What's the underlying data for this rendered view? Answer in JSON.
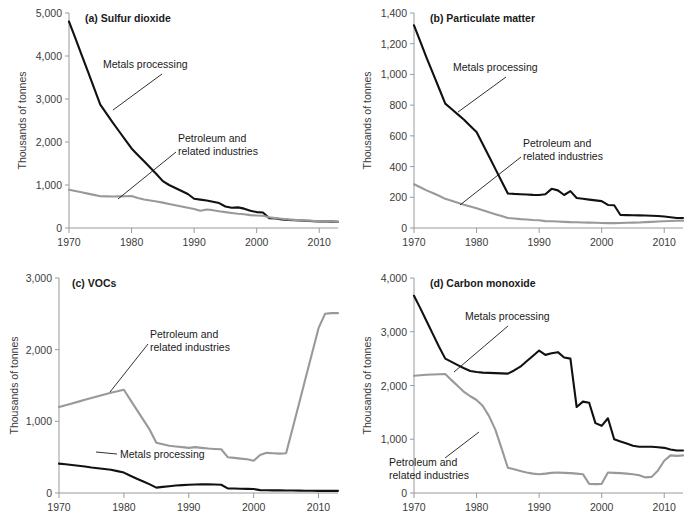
{
  "figure": {
    "shared_ylabel": "Thousands of tonnes",
    "colors": {
      "metals_processing": "#111111",
      "petroleum_related": "#999999",
      "axis": "#9a9a9a",
      "text": "#1a1a1a"
    },
    "series_labels": {
      "metals": "Metals processing",
      "petroleum_line1": "Petroleum and",
      "petroleum_line2": "related industries"
    }
  },
  "chart_data": [
    {
      "id": "a",
      "type": "line",
      "title": "(a) Sulfur dioxide",
      "xlabel": "",
      "ylabel": "Thousands of tonnes",
      "xlim": [
        1970,
        2013
      ],
      "ylim": [
        0,
        5000
      ],
      "xticks": [
        1970,
        1980,
        1990,
        2000,
        2010
      ],
      "xticklabels": [
        "1970",
        "1980",
        "1990",
        "2000",
        "2010"
      ],
      "yticks": [
        0,
        1000,
        2000,
        3000,
        4000,
        5000
      ],
      "yticklabels": [
        "0",
        "1,000",
        "2,000",
        "3,000",
        "4,000",
        "5,000"
      ],
      "grid": false,
      "legend": "annotated-inline",
      "annotations": [
        {
          "text": "Metals processing",
          "target_year": 1975,
          "target_value": 2870
        },
        {
          "text": "Petroleum and related industries",
          "target_year": 1977,
          "target_value": 730
        }
      ],
      "x": [
        1970,
        1971,
        1972,
        1973,
        1974,
        1975,
        1976,
        1977,
        1978,
        1979,
        1980,
        1981,
        1982,
        1983,
        1984,
        1985,
        1986,
        1987,
        1988,
        1989,
        1990,
        1991,
        1992,
        1993,
        1994,
        1995,
        1996,
        1997,
        1998,
        1999,
        2000,
        2001,
        2002,
        2003,
        2004,
        2005,
        2006,
        2007,
        2008,
        2009,
        2010,
        2011,
        2012,
        2013
      ],
      "series": [
        {
          "name": "Metals processing",
          "color": "#111111",
          "values": [
            4800,
            4420,
            4030,
            3650,
            3260,
            2870,
            2660,
            2450,
            2250,
            2050,
            1850,
            1700,
            1550,
            1400,
            1250,
            1090,
            1000,
            930,
            860,
            790,
            680,
            660,
            640,
            610,
            580,
            500,
            470,
            480,
            450,
            400,
            370,
            360,
            230,
            220,
            200,
            190,
            180,
            175,
            170,
            160,
            155,
            150,
            148,
            145
          ]
        },
        {
          "name": "Petroleum and related industries",
          "color": "#999999",
          "values": [
            890,
            860,
            830,
            800,
            770,
            740,
            735,
            732,
            735,
            740,
            745,
            700,
            665,
            640,
            615,
            590,
            560,
            530,
            500,
            470,
            440,
            400,
            430,
            415,
            390,
            370,
            350,
            330,
            320,
            300,
            290,
            285,
            250,
            230,
            215,
            200,
            190,
            180,
            175,
            165,
            160,
            155,
            150,
            145
          ]
        }
      ]
    },
    {
      "id": "b",
      "type": "line",
      "title": "(b) Particulate matter",
      "xlabel": "",
      "ylabel": "Thousands of tonnes",
      "xlim": [
        1970,
        2013
      ],
      "ylim": [
        0,
        1400
      ],
      "xticks": [
        1970,
        1980,
        1990,
        2000,
        2010
      ],
      "xticklabels": [
        "1970",
        "1980",
        "1990",
        "2000",
        "2010"
      ],
      "yticks": [
        0,
        200,
        400,
        600,
        800,
        1000,
        1200,
        1400
      ],
      "yticklabels": [
        "0",
        "200",
        "400",
        "600",
        "800",
        "1,000",
        "1,200",
        "1,400"
      ],
      "grid": false,
      "legend": "annotated-inline",
      "annotations": [
        {
          "text": "Metals processing",
          "target_year": 1975,
          "target_value": 810
        },
        {
          "text": "Petroleum and related industries",
          "target_year": 1977,
          "target_value": 150
        }
      ],
      "x": [
        1970,
        1971,
        1972,
        1973,
        1974,
        1975,
        1976,
        1977,
        1978,
        1979,
        1980,
        1981,
        1982,
        1983,
        1984,
        1985,
        1986,
        1987,
        1988,
        1989,
        1990,
        1991,
        1992,
        1993,
        1994,
        1995,
        1996,
        1997,
        1998,
        1999,
        2000,
        2001,
        2002,
        2003,
        2004,
        2005,
        2006,
        2007,
        2008,
        2009,
        2010,
        2011,
        2012,
        2013
      ],
      "series": [
        {
          "name": "Metals processing",
          "color": "#111111",
          "values": [
            1320,
            1215,
            1110,
            1010,
            910,
            810,
            775,
            740,
            705,
            665,
            625,
            545,
            465,
            385,
            305,
            225,
            222,
            220,
            218,
            216,
            215,
            220,
            255,
            245,
            215,
            240,
            195,
            190,
            185,
            180,
            175,
            150,
            148,
            85,
            84,
            83,
            82,
            81,
            80,
            78,
            75,
            70,
            65,
            65
          ]
        },
        {
          "name": "Petroleum and related industries",
          "color": "#999999",
          "values": [
            285,
            265,
            245,
            228,
            210,
            190,
            178,
            165,
            152,
            140,
            128,
            115,
            102,
            90,
            78,
            65,
            62,
            58,
            55,
            52,
            50,
            45,
            44,
            42,
            40,
            38,
            37,
            36,
            35,
            34,
            33,
            32,
            32,
            33,
            34,
            35,
            36,
            38,
            40,
            42,
            44,
            46,
            47,
            48
          ]
        }
      ]
    },
    {
      "id": "c",
      "type": "line",
      "title": "(c) VOCs",
      "xlabel": "",
      "ylabel": "Thousands of tonnes",
      "xlim": [
        1970,
        2013
      ],
      "ylim": [
        0,
        3000
      ],
      "xticks": [
        1970,
        1980,
        1990,
        2000,
        2010
      ],
      "xticklabels": [
        "1970",
        "1980",
        "1990",
        "2000",
        "2010"
      ],
      "yticks": [
        0,
        1000,
        2000,
        3000
      ],
      "yticklabels": [
        "0",
        "1,000",
        "2,000",
        "3,000"
      ],
      "grid": false,
      "legend": "annotated-inline",
      "annotations": [
        {
          "text": "Petroleum and related industries",
          "target_year": 1981,
          "target_value": 1430
        },
        {
          "text": "Metals processing",
          "target_year": 1978,
          "target_value": 325
        }
      ],
      "x": [
        1970,
        1971,
        1972,
        1973,
        1974,
        1975,
        1976,
        1977,
        1978,
        1979,
        1980,
        1981,
        1982,
        1983,
        1984,
        1985,
        1986,
        1987,
        1988,
        1989,
        1990,
        1991,
        1992,
        1993,
        1994,
        1995,
        1996,
        1997,
        1998,
        1999,
        2000,
        2001,
        2002,
        2003,
        2004,
        2005,
        2006,
        2007,
        2008,
        2009,
        2010,
        2011,
        2012,
        2013
      ],
      "series": [
        {
          "name": "Petroleum and related industries",
          "color": "#999999",
          "values": [
            1200,
            1225,
            1250,
            1275,
            1300,
            1325,
            1350,
            1375,
            1400,
            1420,
            1440,
            1300,
            1160,
            1020,
            880,
            700,
            680,
            660,
            650,
            640,
            630,
            640,
            630,
            620,
            615,
            610,
            500,
            490,
            480,
            470,
            450,
            530,
            560,
            555,
            550,
            555,
            900,
            1250,
            1600,
            1950,
            2300,
            2500,
            2510,
            2510
          ]
        },
        {
          "name": "Metals processing",
          "color": "#111111",
          "values": [
            410,
            400,
            390,
            380,
            370,
            355,
            345,
            335,
            325,
            305,
            285,
            240,
            200,
            160,
            120,
            75,
            85,
            95,
            105,
            110,
            115,
            118,
            120,
            120,
            118,
            115,
            65,
            62,
            60,
            58,
            55,
            40,
            38,
            37,
            36,
            35,
            34,
            33,
            32,
            31,
            30,
            30,
            30,
            30
          ]
        }
      ]
    },
    {
      "id": "d",
      "type": "line",
      "title": "(d) Carbon monoxide",
      "xlabel": "",
      "ylabel": "Thousands of tonnes",
      "xlim": [
        1970,
        2013
      ],
      "ylim": [
        0,
        4000
      ],
      "xticks": [
        1970,
        1980,
        1990,
        2000,
        2010
      ],
      "xticklabels": [
        "1970",
        "1980",
        "1990",
        "2000",
        "2010"
      ],
      "yticks": [
        0,
        1000,
        2000,
        3000,
        4000
      ],
      "yticklabels": [
        "0",
        "1,000",
        "2,000",
        "3,000",
        "4,000"
      ],
      "grid": false,
      "legend": "annotated-inline",
      "annotations": [
        {
          "text": "Metals processing",
          "target_year": 1977,
          "target_value": 2380
        },
        {
          "text": "Petroleum and related industries",
          "target_year": 1983,
          "target_value": 1180
        }
      ],
      "x": [
        1970,
        1971,
        1972,
        1973,
        1974,
        1975,
        1976,
        1977,
        1978,
        1979,
        1980,
        1981,
        1982,
        1983,
        1984,
        1985,
        1986,
        1987,
        1988,
        1989,
        1990,
        1991,
        1992,
        1993,
        1994,
        1995,
        1996,
        1997,
        1998,
        1999,
        2000,
        2001,
        2002,
        2003,
        2004,
        2005,
        2006,
        2007,
        2008,
        2009,
        2010,
        2011,
        2012,
        2013
      ],
      "series": [
        {
          "name": "Metals processing",
          "color": "#111111",
          "values": [
            3670,
            3440,
            3200,
            2960,
            2720,
            2500,
            2440,
            2380,
            2320,
            2270,
            2250,
            2240,
            2235,
            2230,
            2225,
            2220,
            2280,
            2350,
            2450,
            2550,
            2650,
            2570,
            2600,
            2620,
            2520,
            2500,
            1600,
            1700,
            1680,
            1300,
            1250,
            1390,
            1000,
            960,
            920,
            880,
            860,
            860,
            860,
            850,
            840,
            810,
            790,
            790
          ]
        },
        {
          "name": "Petroleum and related industries",
          "color": "#999999",
          "values": [
            2180,
            2190,
            2200,
            2205,
            2210,
            2215,
            2100,
            1990,
            1880,
            1800,
            1730,
            1620,
            1430,
            1180,
            830,
            470,
            440,
            410,
            380,
            360,
            350,
            360,
            375,
            380,
            375,
            370,
            360,
            350,
            170,
            165,
            170,
            380,
            375,
            370,
            360,
            350,
            330,
            290,
            300,
            420,
            600,
            700,
            690,
            700
          ]
        }
      ]
    }
  ]
}
